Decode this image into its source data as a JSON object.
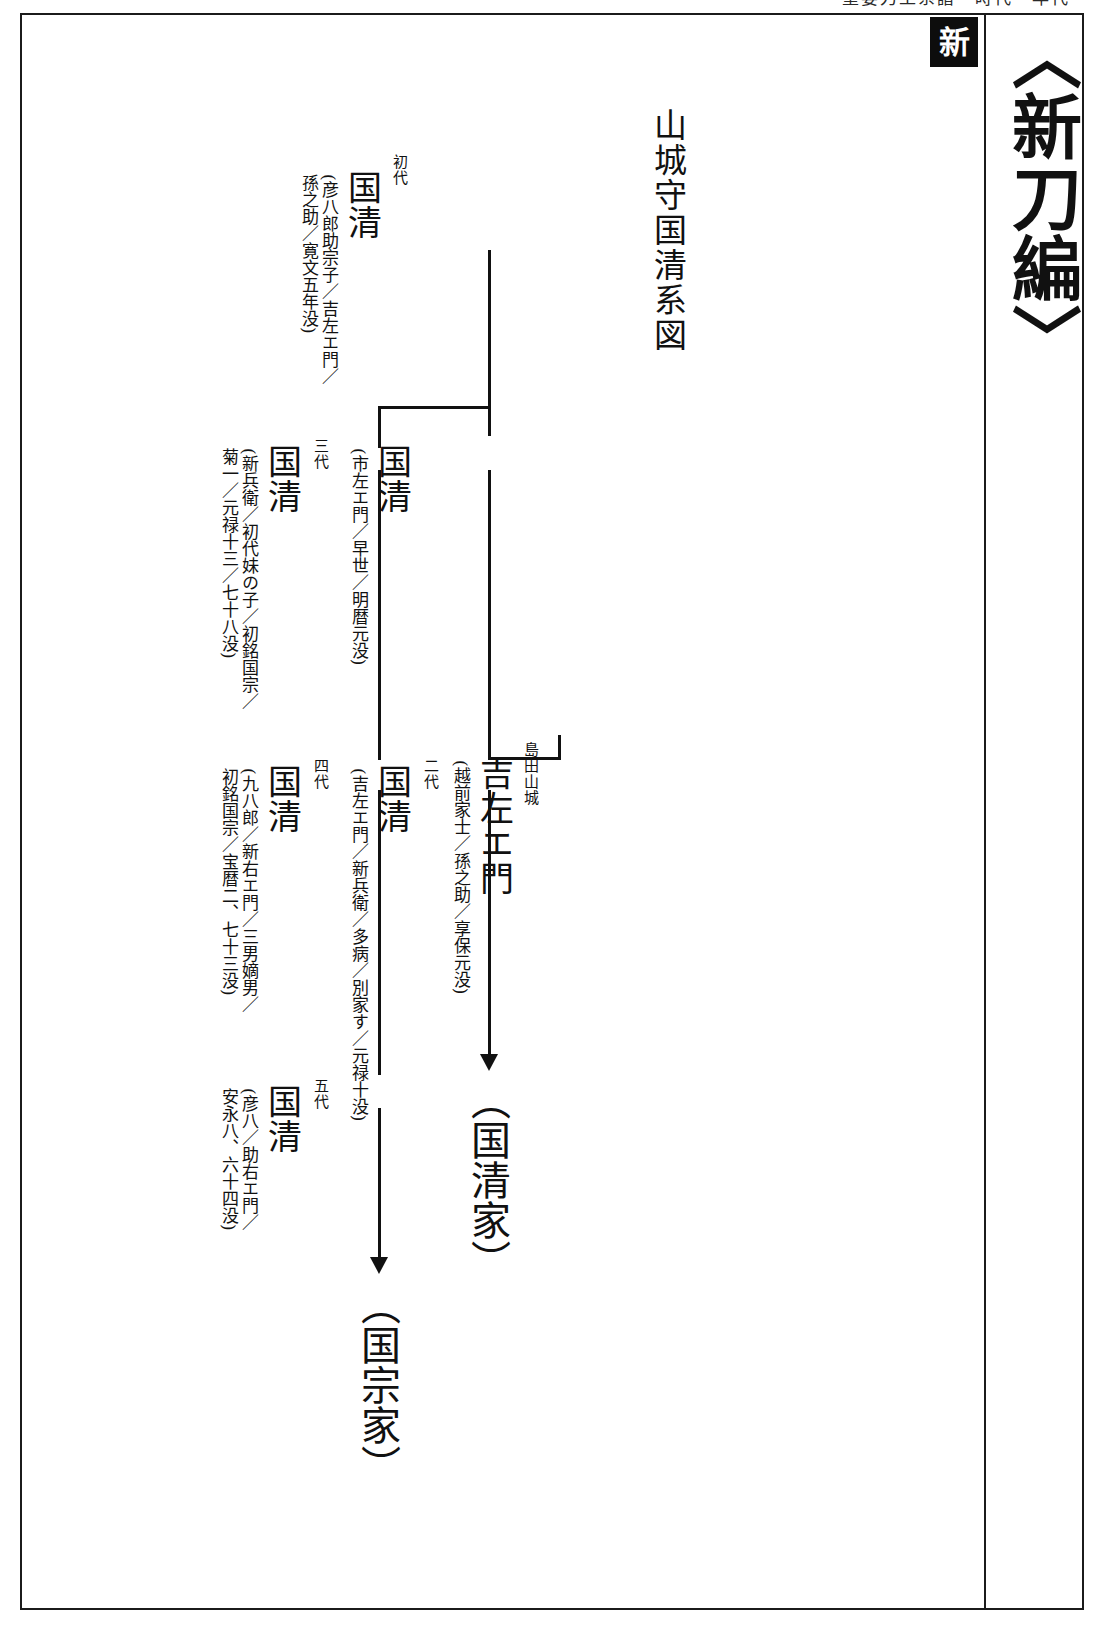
{
  "page": {
    "running_head": "重要刀工系譜　時代・年代",
    "section_tab": "新",
    "book_title": "〈新刀編〉"
  },
  "chart": {
    "title": "山城守国清系図",
    "type": "genealogy-tree",
    "nodes": [
      {
        "id": "gen1",
        "generation": "初代",
        "name": "国清",
        "note": "(彦八郎助宗子／吉左エ門／",
        "note2": "孫之助／寛文五年没)"
      },
      {
        "id": "gen1b",
        "generation": "",
        "name": "国清",
        "note": "(市左エ門／早世／明暦元没)",
        "note2": ""
      },
      {
        "id": "gen3",
        "generation": "三代",
        "name": "国清",
        "note": "(新兵衛／初代妹の子／初銘国宗／",
        "note2": "菊一／元禄十三／七十八没)"
      },
      {
        "id": "shimada",
        "generation": "",
        "prefix": "島田山城",
        "name": "吉左エ門",
        "note": "(越前家士／孫之助／享保元没)",
        "note2": ""
      },
      {
        "id": "gen2",
        "generation": "二代",
        "name": "国清",
        "note": "(吉左エ門／新兵衛／多病／別家す／元禄十没)",
        "note2": ""
      },
      {
        "id": "gen4",
        "generation": "四代",
        "name": "国清",
        "note": "(九八郎／新右エ門／三男嫡男／",
        "note2": "初銘国宗／宝暦二、七十三没)"
      },
      {
        "id": "gen5",
        "generation": "五代",
        "name": "国清",
        "note": "(彦八／助右エ門／",
        "note2": "安永八、六十四没)"
      }
    ],
    "terminals": [
      {
        "id": "house-kunikiyo",
        "label": "（国清家）"
      },
      {
        "id": "house-kunimune",
        "label": "（国宗家）"
      }
    ]
  }
}
